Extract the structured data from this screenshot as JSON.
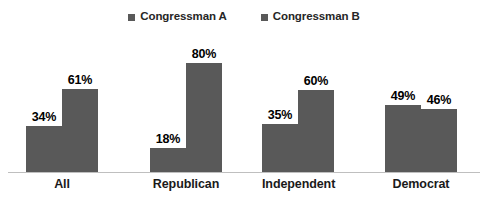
{
  "chart_data": {
    "type": "bar",
    "title": "",
    "subtitle": "",
    "xlabel": "",
    "ylabel": "",
    "ylim": [
      0,
      100
    ],
    "grid": false,
    "legend_position": "top-center",
    "value_suffix": "%",
    "categories": [
      "All",
      "Republican",
      "Independent",
      "Democrat"
    ],
    "series": [
      {
        "name": "Congressman A",
        "color": "#595959",
        "values": [
          34,
          18,
          35,
          49
        ],
        "labels": [
          "34%",
          "18%",
          "35%",
          "49%"
        ]
      },
      {
        "name": "Congressman B",
        "color": "#595959",
        "values": [
          61,
          80,
          60,
          46
        ],
        "labels": [
          "61%",
          "80%",
          "60%",
          "46%"
        ]
      }
    ]
  },
  "legend": {
    "items": [
      {
        "label": "Congressman A",
        "swatch_color": "#595959"
      },
      {
        "label": "Congressman B",
        "swatch_color": "#595959"
      }
    ]
  },
  "axis": {
    "baseline_color": "#bfbfbf",
    "categories": [
      {
        "label": "All"
      },
      {
        "label": "Republican"
      },
      {
        "label": "Independent"
      },
      {
        "label": "Democrat"
      }
    ]
  },
  "bars": [
    {
      "group": "All",
      "series": "Congressman A",
      "value": 34,
      "label": "34%"
    },
    {
      "group": "All",
      "series": "Congressman B",
      "value": 61,
      "label": "61%"
    },
    {
      "group": "Republican",
      "series": "Congressman A",
      "value": 18,
      "label": "18%"
    },
    {
      "group": "Republican",
      "series": "Congressman B",
      "value": 80,
      "label": "80%"
    },
    {
      "group": "Independent",
      "series": "Congressman A",
      "value": 35,
      "label": "35%"
    },
    {
      "group": "Independent",
      "series": "Congressman B",
      "value": 60,
      "label": "60%"
    },
    {
      "group": "Democrat",
      "series": "Congressman A",
      "value": 49,
      "label": "49%"
    },
    {
      "group": "Democrat",
      "series": "Congressman B",
      "value": 46,
      "label": "46%"
    }
  ]
}
